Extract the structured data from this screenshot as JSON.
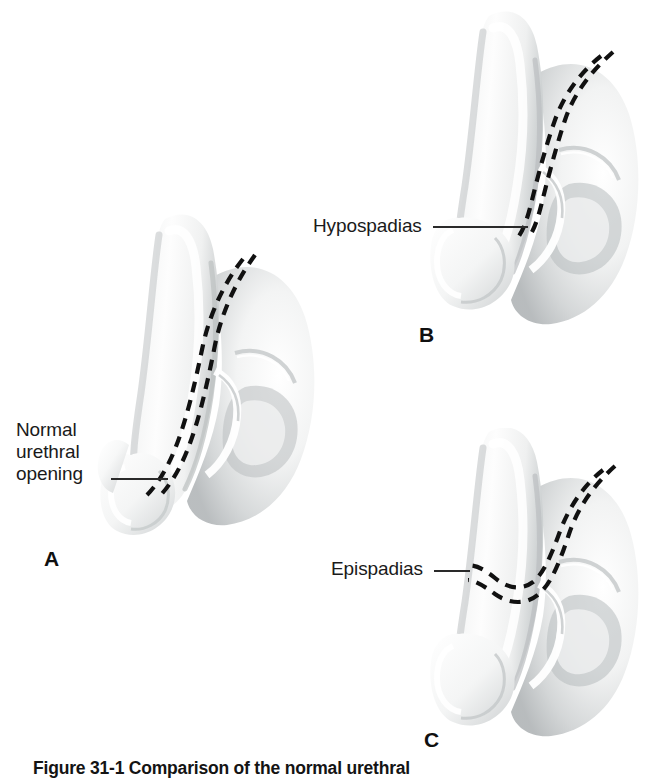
{
  "figure": {
    "caption": "Figure 31-1  Comparison of the normal urethral",
    "panel_letters": [
      "A",
      "B",
      "C"
    ]
  },
  "panels": [
    {
      "id": "a",
      "letter": "A",
      "label_lines": [
        "Normal",
        "urethral",
        "opening"
      ],
      "label_full": "Normal urethral opening",
      "condition": "normal"
    },
    {
      "id": "b",
      "letter": "B",
      "label_lines": [
        "Hypospadias"
      ],
      "label_full": "Hypospadias",
      "condition": "hypospadias"
    },
    {
      "id": "c",
      "letter": "C",
      "label_lines": [
        "Epispadias"
      ],
      "label_full": "Epispadias",
      "condition": "epispadias"
    }
  ],
  "colors": {
    "background": "#ffffff",
    "tissue_light": "#fbfbfb",
    "tissue_mid": "#eceded",
    "tissue_shadow": "#c9cccd",
    "tissue_deep_shadow": "#a9adaf",
    "urethra_dash": "#111111",
    "leader_line": "#2a2a2a",
    "text": "#1a1a1a"
  }
}
